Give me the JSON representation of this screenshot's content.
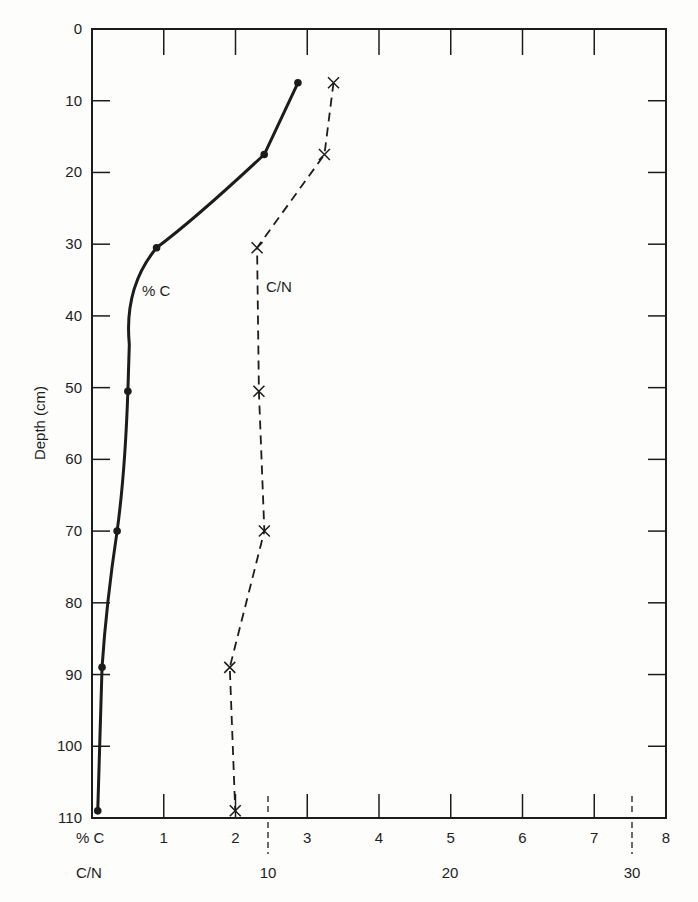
{
  "chart_data": {
    "type": "line",
    "title": "",
    "ylabel": "Depth (cm)",
    "xlabel_primary": "% C",
    "xlabel_secondary": "C/N",
    "ylim": [
      0,
      110
    ],
    "y_inverted": true,
    "y_ticks": [
      0,
      10,
      20,
      30,
      40,
      50,
      60,
      70,
      80,
      90,
      100,
      110
    ],
    "x_primary": {
      "label": "% C",
      "range": [
        0,
        8
      ],
      "ticks": [
        1,
        2,
        3,
        4,
        5,
        6,
        7,
        8
      ]
    },
    "x_secondary": {
      "label": "C/N",
      "ticks": [
        10,
        20,
        30
      ],
      "dashed_tick_positions_pct_c": [
        2.45,
        7.5
      ]
    },
    "grid": false,
    "legend": "inline labels",
    "series": [
      {
        "name": "% C",
        "style": "solid curve with dot markers",
        "depth": [
          7.5,
          17.5,
          30.5,
          50.5,
          70,
          89,
          109
        ],
        "values": [
          2.87,
          2.4,
          0.9,
          0.5,
          0.35,
          0.14,
          0.08
        ]
      },
      {
        "name": "C/N",
        "style": "dashed line with x markers",
        "depth": [
          7.5,
          17.5,
          30.5,
          50.5,
          70,
          89,
          109
        ],
        "values": [
          13.6,
          13.1,
          9.4,
          9.5,
          9.8,
          7.9,
          8.2
        ]
      }
    ],
    "annotations": [
      "% C",
      "C/N"
    ]
  },
  "labels": {
    "yaxis": "Depth (cm)",
    "pct_c_row": "% C",
    "cn_row": "C/N",
    "series_pct_c": "% C",
    "series_cn": "C/N"
  }
}
